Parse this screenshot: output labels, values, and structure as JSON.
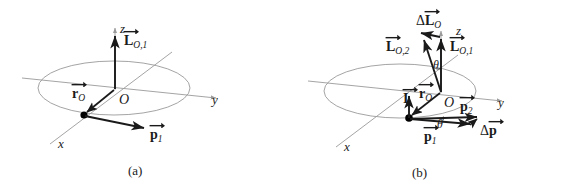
{
  "figure": {
    "type": "physics-vector-diagram",
    "background": "#ffffff",
    "colors": {
      "axis": "#9a9a9a",
      "ellipse": "#9a9a9a",
      "vector": "#1a1a1a",
      "text": "#1a1a1a",
      "particle": "#000000"
    }
  },
  "panels": [
    {
      "id": "a",
      "caption": "(a)",
      "axes": {
        "x": "x",
        "y": "y",
        "z": "z"
      },
      "origin_label": "O",
      "vectors": [
        {
          "name": "position-vector",
          "symbol": "r",
          "sub": "O",
          "delta": false
        },
        {
          "name": "angular-momentum-initial",
          "symbol": "L",
          "sub": "O,1",
          "delta": false
        },
        {
          "name": "momentum-initial",
          "symbol": "p",
          "sub": "1",
          "delta": false
        }
      ]
    },
    {
      "id": "b",
      "caption": "(b)",
      "axes": {
        "x": "x",
        "y": "y",
        "z": "z"
      },
      "origin_label": "O",
      "angle_label": "θ",
      "angle_count": 2,
      "vectors": [
        {
          "name": "angular-momentum-change",
          "symbol": "L",
          "sub": "O",
          "delta": true
        },
        {
          "name": "angular-momentum-final",
          "symbol": "L",
          "sub": "O,2",
          "delta": false
        },
        {
          "name": "angular-momentum-initial",
          "symbol": "L",
          "sub": "O,1",
          "delta": false
        },
        {
          "name": "impulse",
          "symbol": "I",
          "sub": "",
          "delta": false
        },
        {
          "name": "position-vector",
          "symbol": "r",
          "sub": "O",
          "delta": false
        },
        {
          "name": "momentum-final",
          "symbol": "p",
          "sub": "2",
          "delta": false
        },
        {
          "name": "momentum-initial",
          "symbol": "p",
          "sub": "1",
          "delta": false
        },
        {
          "name": "momentum-change",
          "symbol": "p",
          "sub": "",
          "delta": true
        }
      ]
    }
  ],
  "labels": {
    "a": {
      "z": "z",
      "y": "y",
      "x": "x",
      "O": "O",
      "caption": "(a)",
      "L1_sym": "L",
      "L1_sub": "O,1",
      "r_sym": "r",
      "r_sub": "O",
      "p1_sym": "p",
      "p1_sub": "1"
    },
    "b": {
      "z": "z",
      "y": "y",
      "x": "x",
      "O": "O",
      "caption": "(b)",
      "dL_delta": "Δ",
      "dL_sym": "L",
      "dL_sub": "O",
      "L2_sym": "L",
      "L2_sub": "O,2",
      "L1_sym": "L",
      "L1_sub": "O,1",
      "I_sym": "I",
      "r_sym": "r",
      "r_sub": "O",
      "p2_sym": "p",
      "p2_sub": "2",
      "p1_sym": "p",
      "p1_sub": "1",
      "dp_delta": "Δ",
      "dp_sym": "p",
      "theta_top": "θ",
      "theta_bottom": "θ"
    }
  }
}
